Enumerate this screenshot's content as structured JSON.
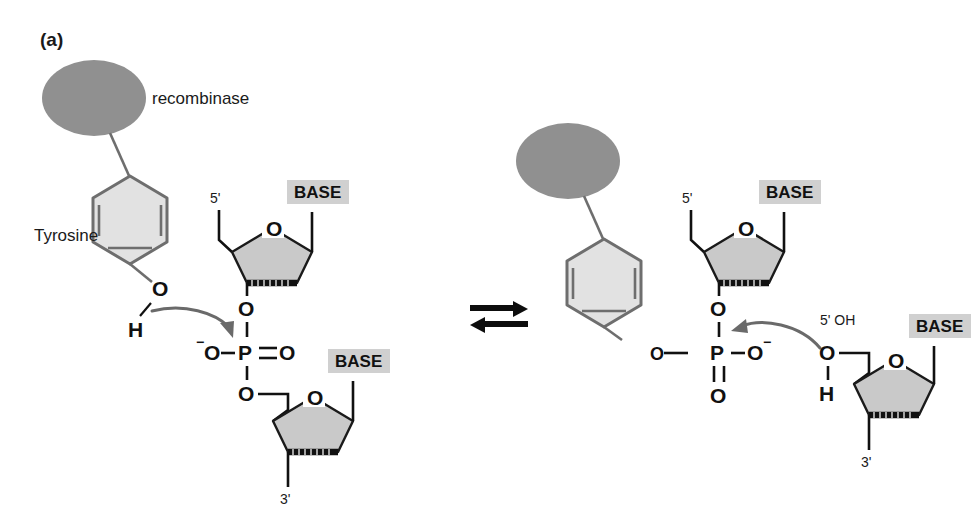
{
  "figure": {
    "panel_label": "(a)",
    "background_color": "#ffffff",
    "protein_color": "#909090",
    "ring_fill_color": "#e2e2e2",
    "sugar_fill_color": "#c9c9c9",
    "base_box_color": "#d0d0d0",
    "arrow_color": "#6a6a6a"
  },
  "labels": {
    "recombinase": "recombinase",
    "tyrosine": "Tyrosine",
    "base": "BASE",
    "five_prime": "5'",
    "three_prime": "3'",
    "five_prime_oh": "5' OH",
    "atom_o": "O",
    "atom_p": "P",
    "atom_h": "H",
    "charge_minus": "−",
    "equilibrium": "⇌"
  },
  "left_structure": {
    "name": "tyrosine-attacks-phosphodiester",
    "protein_label": "recombinase",
    "amino_acid_label": "Tyrosine",
    "hydroxyl": {
      "oxygen": "O",
      "hydrogen": "H"
    },
    "phosphate": {
      "center": "P",
      "top_oxygen": "O",
      "left_oxygen": "O",
      "left_charge": "−",
      "right_oxygen": "O",
      "right_bond": "double",
      "bottom_oxygen": "O"
    },
    "upper_sugar": {
      "ring_oxygen": "O",
      "end_label": "5'",
      "base_label": "BASE"
    },
    "lower_sugar": {
      "ring_oxygen": "O",
      "end_label": "3'",
      "base_label": "BASE"
    },
    "mechanism_arrow": "nucleophilic-attack-of-tyrosine-OH-on-phosphorus"
  },
  "right_structure": {
    "name": "covalent-phosphotyrosine-intermediate",
    "protein_label": "recombinase",
    "hydroxyl": {
      "oxygen": "O",
      "hydrogen": "H",
      "annotation": "5' OH"
    },
    "phosphate": {
      "center": "P",
      "top_oxygen": "O",
      "bottom_oxygen": "O",
      "bottom_bond": "double",
      "left_oxygen": "O",
      "right_oxygen": "O",
      "right_charge": "−"
    },
    "upper_sugar": {
      "ring_oxygen": "O",
      "end_label": "5'",
      "base_label": "BASE"
    },
    "lower_sugar": {
      "ring_oxygen": "O",
      "end_label": "3'",
      "base_label": "BASE"
    },
    "mechanism_arrow": "attack-of-free-5-prime-OH-on-phosphorus"
  },
  "reaction": {
    "symbol": "⇌",
    "type": "equilibrium"
  }
}
